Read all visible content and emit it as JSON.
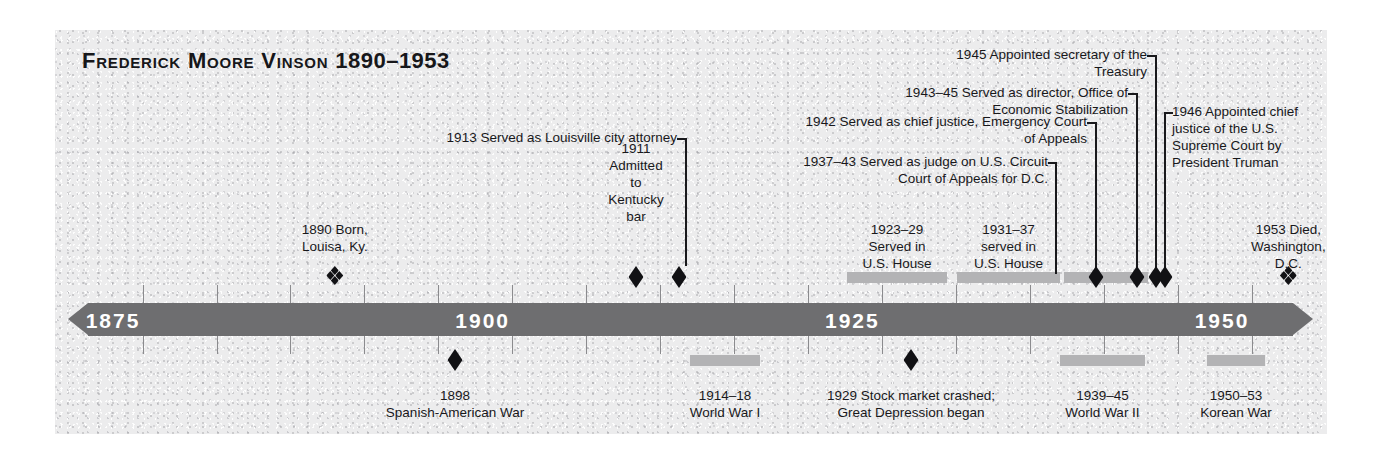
{
  "title": {
    "name": "Frederick Moore Vinson",
    "years": "1890–1953"
  },
  "axis": {
    "labels": [
      "1875",
      "1900",
      "1925",
      "1950"
    ],
    "range": [
      1872,
      1955
    ],
    "tick_interval_years": 5
  },
  "colors": {
    "panel": "#ececed",
    "axis_bar": "#6e6e70",
    "axis_label": "#ffffff",
    "marker": "#111114",
    "span_bar": "#b3b3b5",
    "text": "#18181b"
  },
  "life_events": [
    {
      "id": "born",
      "year": 1890,
      "marker": "clover",
      "text": "1890 Born,\nLouisa, Ky.",
      "align": "center"
    },
    {
      "id": "kentucky-bar",
      "year": 1911,
      "marker": "diamond",
      "text": "1911\nAdmitted\nto\nKentucky\nbar",
      "align": "center"
    },
    {
      "id": "louisville-city-attorney",
      "year": 1913,
      "marker": "diamond",
      "text": "1913 Served as Louisville city attorney",
      "align": "right"
    },
    {
      "id": "us-house-1",
      "year_start": 1923,
      "year_end": 1929,
      "marker": "span",
      "text": "1923–29\nServed in\nU.S. House",
      "align": "center"
    },
    {
      "id": "us-house-2",
      "year_start": 1931,
      "year_end": 1937,
      "marker": "span",
      "text": "1931–37\nserved in\nU.S. House",
      "align": "center"
    },
    {
      "id": "circuit-court-judge",
      "year_start": 1937,
      "year_end": 1943,
      "marker": "span",
      "text": "1937–43 Served as judge on U.S. Circuit\nCourt of Appeals for D.C.",
      "align": "right"
    },
    {
      "id": "emergency-court-chief-justice",
      "year": 1942,
      "marker": "diamond",
      "text": "1942 Served as chief justice, Emergency Court of Appeals",
      "align": "right"
    },
    {
      "id": "economic-stabilization-director",
      "year_start": 1943,
      "year_end": 1945,
      "marker": "diamond",
      "text": "1943–45 Served as director, Office of Economic Stabilization",
      "align": "right"
    },
    {
      "id": "secretary-of-treasury",
      "year": 1945,
      "marker": "diamond",
      "text": "1945 Appointed secretary of the Treasury",
      "align": "right"
    },
    {
      "id": "chief-justice-supreme-court",
      "year": 1946,
      "marker": "diamond",
      "text": "1946 Appointed chief\njustice of the U.S.\nSupreme Court by\nPresident Truman",
      "align": "left"
    },
    {
      "id": "died",
      "year": 1953,
      "marker": "clover",
      "text": "1953 Died,\nWashington,\nD.C.",
      "align": "center"
    }
  ],
  "context_events": [
    {
      "id": "spanish-american-war",
      "year": 1898,
      "marker": "diamond",
      "text": "1898\nSpanish-American War"
    },
    {
      "id": "world-war-i",
      "year_start": 1914,
      "year_end": 1918,
      "marker": "span",
      "text": "1914–18\nWorld War I"
    },
    {
      "id": "stock-market-crash",
      "year": 1929,
      "marker": "diamond",
      "text": "1929 Stock market crashed;\nGreat Depression began"
    },
    {
      "id": "world-war-ii",
      "year_start": 1939,
      "year_end": 1945,
      "marker": "span",
      "text": "1939–45\nWorld  War II"
    },
    {
      "id": "korean-war",
      "year_start": 1950,
      "year_end": 1953,
      "marker": "span",
      "text": "1950–53\nKorean War"
    }
  ]
}
